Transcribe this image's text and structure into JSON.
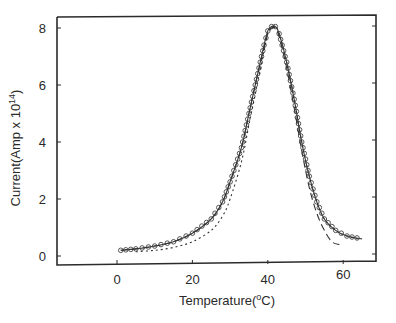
{
  "chart_data": {
    "type": "line",
    "title": "",
    "xlabel": "Temperature(°C)",
    "xlabel_parts": {
      "main": "Temperature(",
      "sup": "o",
      "tail": "C)"
    },
    "ylabel": "Current(Amp x 10^14)",
    "ylabel_parts": {
      "main": "Current(Amp x 10",
      "sup": "14",
      "tail": ")"
    },
    "xlim": [
      -15,
      69
    ],
    "ylim": [
      -0.3,
      8.3
    ],
    "x_ticks": [
      0,
      20,
      40,
      60
    ],
    "y_ticks": [
      0,
      2,
      4,
      6,
      8
    ],
    "grid": false,
    "legend": null,
    "series": [
      {
        "name": "experimental",
        "style": "solid-with-circles",
        "x": [
          1,
          5,
          10,
          15,
          20,
          25,
          28,
          30,
          33,
          35,
          37,
          39,
          40,
          41,
          42,
          43,
          45,
          47,
          49,
          51,
          53,
          55,
          58,
          61,
          65
        ],
        "y": [
          0.2,
          0.25,
          0.35,
          0.5,
          0.8,
          1.3,
          1.9,
          2.6,
          3.8,
          5.0,
          6.2,
          7.4,
          7.9,
          8.05,
          8.05,
          7.8,
          6.8,
          5.5,
          4.0,
          2.8,
          1.9,
          1.3,
          0.9,
          0.7,
          0.6
        ]
      },
      {
        "name": "fit-dashed",
        "style": "dashed",
        "x": [
          1,
          5,
          10,
          15,
          20,
          25,
          28,
          30,
          33,
          35,
          37,
          39,
          40,
          41,
          42,
          43,
          45,
          47,
          49,
          51,
          53,
          55,
          57,
          59
        ],
        "y": [
          0.2,
          0.25,
          0.35,
          0.5,
          0.8,
          1.3,
          1.9,
          2.6,
          3.8,
          5.0,
          6.2,
          7.3,
          7.8,
          8.0,
          8.0,
          7.7,
          6.6,
          5.2,
          3.7,
          2.4,
          1.5,
          0.9,
          0.5,
          0.4
        ]
      },
      {
        "name": "fit-dotted",
        "style": "dotted",
        "x": [
          5,
          10,
          15,
          20,
          25,
          28,
          30,
          33,
          35,
          37,
          39,
          40,
          41,
          42,
          43,
          45,
          47,
          49,
          51,
          53,
          55,
          58,
          61,
          64
        ],
        "y": [
          0.15,
          0.2,
          0.3,
          0.5,
          0.9,
          1.4,
          2.0,
          3.3,
          4.6,
          5.9,
          7.2,
          7.8,
          8.0,
          8.05,
          7.8,
          6.8,
          5.5,
          4.0,
          2.8,
          1.9,
          1.3,
          0.9,
          0.7,
          0.6
        ]
      }
    ]
  }
}
